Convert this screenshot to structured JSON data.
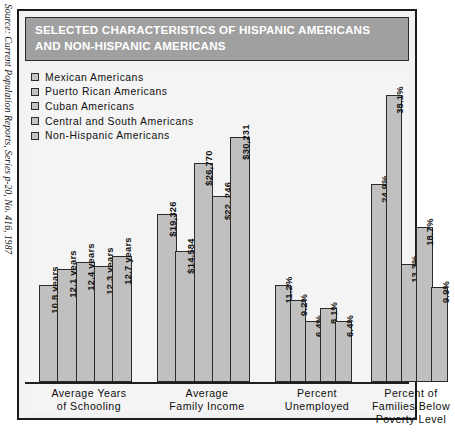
{
  "source_note": "Source: Current Population Reports, Series p-20, No. 416, 1987",
  "title": {
    "line1": "SELECTED CHARACTERISTICS OF HISPANIC AMERICANS",
    "line2": "AND NON-HISPANIC AMERICANS"
  },
  "colors": {
    "title_band": "#a0a0a0",
    "bar_fill": "#c0c0c0",
    "bar_border": "#2b2b2b",
    "frame": "#1b1b1b",
    "plot_background": "#f4f4f4"
  },
  "legend": {
    "items": [
      {
        "label": "Mexican  Americans",
        "swatch": "#c3c3c3"
      },
      {
        "label": "Puerto  Rican  Americans",
        "swatch": "#c3c3c3"
      },
      {
        "label": "Cuban  Americans",
        "swatch": "#c3c3c3"
      },
      {
        "label": "Central  and  South  Americans",
        "swatch": "#c3c3c3"
      },
      {
        "label": "Non-Hispanic  Americans",
        "swatch": "#c3c3c3"
      }
    ]
  },
  "chart_data": {
    "type": "bar",
    "title": "SELECTED CHARACTERISTICS OF HISPANIC AMERICANS AND NON-HISPANIC AMERICANS",
    "xlabel": "",
    "ylabel": "",
    "grid": false,
    "legend_position": "top-left",
    "series": [
      {
        "name": "Mexican Americans"
      },
      {
        "name": "Puerto Rican Americans"
      },
      {
        "name": "Cuban Americans"
      },
      {
        "name": "Central and South Americans"
      },
      {
        "name": "Non-Hispanic Americans"
      }
    ],
    "groups": [
      {
        "category_lines": [
          "Average  Years",
          "of  Schooling"
        ],
        "unit": "years",
        "bars": [
          {
            "series": "Mexican Americans",
            "value": 10.8,
            "label": "10.8 years"
          },
          {
            "series": "Puerto Rican Americans",
            "value": 12.1,
            "label": "12.1 years"
          },
          {
            "series": "Cuban Americans",
            "value": 12.4,
            "label": "12.4 years"
          },
          {
            "series": "Central and South Americans",
            "value": 12.3,
            "label": "12.3 years"
          },
          {
            "series": "Non-Hispanic Americans",
            "value": 12.7,
            "label": "12.7 years"
          }
        ]
      },
      {
        "category_lines": [
          "Average",
          "Family  Income"
        ],
        "unit": "USD",
        "bars": [
          {
            "series": "Mexican Americans",
            "value": 19326,
            "label": "$19,326"
          },
          {
            "series": "Puerto Rican Americans",
            "value": 14584,
            "label": "$14,584"
          },
          {
            "series": "Cuban Americans",
            "value": 26770,
            "label": "$26,770"
          },
          {
            "series": "Central and South Americans",
            "value": 22246,
            "label": "$22, 246"
          },
          {
            "series": "Non-Hispanic Americans",
            "value": 30231,
            "label": "$30,231"
          }
        ]
      },
      {
        "category_lines": [
          "Percent",
          "Unemployed"
        ],
        "unit": "percent",
        "bars": [
          {
            "series": "Mexican Americans",
            "value": 11.2,
            "label": "11.2%"
          },
          {
            "series": "Puerto Rican Americans",
            "value": 9.2,
            "label": "9.2%"
          },
          {
            "series": "Cuban Americans",
            "value": 6.4,
            "label": "6.4%"
          },
          {
            "series": "Central and South Americans",
            "value": 8.1,
            "label": "8.1%"
          },
          {
            "series": "Non-Hispanic Americans",
            "value": 6.4,
            "label": "6.4%"
          }
        ]
      },
      {
        "category_lines": [
          "Percent  of",
          "Families  Below",
          "Poverty  Level"
        ],
        "unit": "percent",
        "bars": [
          {
            "series": "Mexican Americans",
            "value": 24.9,
            "label": "24.9%"
          },
          {
            "series": "Puerto Rican Americans",
            "value": 38.1,
            "label": "38.1%"
          },
          {
            "series": "Cuban Americans",
            "value": 13.3,
            "label": "13.3%"
          },
          {
            "series": "Central and South Americans",
            "value": 18.7,
            "label": "18.7%"
          },
          {
            "series": "Non-Hispanic Americans",
            "value": 9.9,
            "label": "9.9%"
          }
        ]
      }
    ]
  },
  "layout": {
    "group_geometry": [
      {
        "left": 14,
        "width": 100,
        "bar_width": 19.6,
        "bar_heights": [
          97,
          113,
          120,
          116,
          126
        ],
        "label_left": 4,
        "label_width": 120
      },
      {
        "left": 132,
        "width": 100,
        "bar_width": 19.6,
        "bar_heights": [
          168,
          131,
          219,
          186,
          245
        ],
        "label_left": 122,
        "label_width": 120
      },
      {
        "left": 250,
        "width": 82,
        "bar_width": 16.4,
        "bar_heights": [
          97,
          82,
          61,
          74,
          61
        ],
        "label_left": 236,
        "label_width": 112
      },
      {
        "left": 346,
        "width": 82,
        "bar_width": 16.4,
        "bar_heights": [
          198,
          287,
          118,
          155,
          95
        ],
        "label_left": 330,
        "label_width": 112
      }
    ]
  }
}
